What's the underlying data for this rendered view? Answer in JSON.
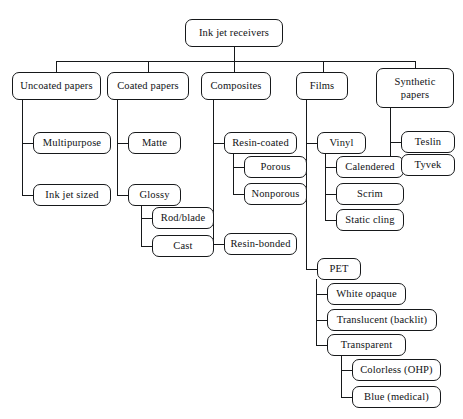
{
  "diagram": {
    "type": "tree-diagram",
    "background_color": "#ffffff",
    "line_color": "#16181a",
    "text_color": "#101214",
    "nodes": {
      "root": "Ink jet receivers",
      "uncoated_papers": "Uncoated papers",
      "coated_papers": "Coated papers",
      "composites": "Composites",
      "films": "Films",
      "synthetic_papers": "Synthetic\npapers",
      "multipurpose": "Multipurpose",
      "ink_jet_sized": "Ink jet sized",
      "matte": "Matte",
      "glossy": "Glossy",
      "rod_blade": "Rod/blade",
      "cast": "Cast",
      "resin_coated": "Resin-coated",
      "porous": "Porous",
      "nonporous": "Nonporous",
      "resin_bonded": "Resin-bonded",
      "vinyl": "Vinyl",
      "calendered": "Calendered",
      "scrim": "Scrim",
      "static_cling": "Static cling",
      "pet": "PET",
      "white_opaque": "White opaque",
      "translucent_backlit": "Translucent (backlit)",
      "transparent": "Transparent",
      "colorless_ohp": "Colorless (OHP)",
      "blue_medical": "Blue (medical)",
      "teslin": "Teslin",
      "tyvek": "Tyvek"
    }
  }
}
